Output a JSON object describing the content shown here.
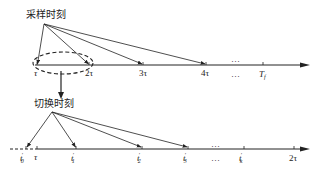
{
  "top_diagram": {
    "label": "采样时刻",
    "axis_ticks": [
      {
        "label": "τ",
        "x": 37
      },
      {
        "label": "2τ",
        "x": 89
      },
      {
        "label": "3τ",
        "x": 143
      },
      {
        "label": "4τ",
        "x": 206
      },
      {
        "label": "…",
        "x": 236
      },
      {
        "label": "T",
        "sub": "f",
        "x": 263
      }
    ],
    "arrow_targets": [
      "τ",
      "2τ",
      "3τ",
      "4τ"
    ],
    "highlight": "dashed ellipse around τ to 2τ interval"
  },
  "bottom_diagram": {
    "label": "切换时刻",
    "axis_ticks": [
      {
        "label": "t",
        "prime": "′",
        "sub": "0",
        "x": 26
      },
      {
        "label": "τ",
        "x": 37
      },
      {
        "label": "t",
        "prime": "′",
        "sub": "1",
        "x": 76
      },
      {
        "label": "t",
        "prime": "′",
        "sub": "2",
        "x": 142
      },
      {
        "label": "t",
        "prime": "′",
        "sub": "3",
        "x": 188
      },
      {
        "label": "…",
        "x": 215
      },
      {
        "label": "t",
        "prime": "′",
        "sub": "k",
        "x": 244
      },
      {
        "label": "2τ",
        "x": 294
      }
    ],
    "arrow_targets": [
      "t0'",
      "t1'",
      "t2'",
      "t3'"
    ]
  },
  "colors": {
    "line": "#222222",
    "background": "#ffffff"
  }
}
